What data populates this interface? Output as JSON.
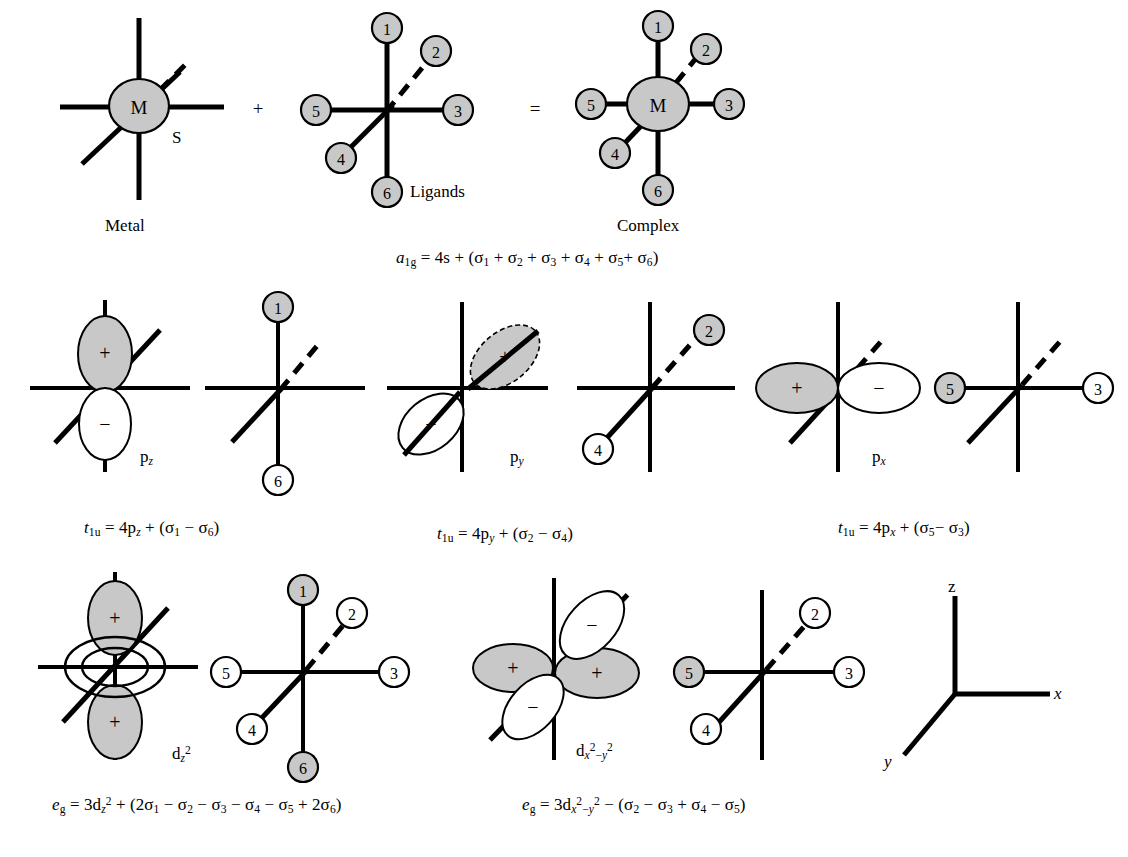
{
  "figure": {
    "domain": "chemistry-orbital-diagram",
    "background": "#ffffff",
    "stroke": "#000000",
    "shaded_fill": "#c8c8c8",
    "white_fill": "#ffffff"
  },
  "row1": {
    "metal": {
      "center_label": "M",
      "s_label": "S",
      "caption": "Metal"
    },
    "plus_sign": "+",
    "ligands": {
      "caption": "Ligands",
      "numbers": [
        "1",
        "2",
        "3",
        "4",
        "5",
        "6"
      ],
      "shaded": [
        true,
        true,
        true,
        true,
        true,
        true
      ]
    },
    "equals_sign": "=",
    "complex": {
      "center_label": "M",
      "caption": "Complex",
      "numbers": [
        "1",
        "2",
        "3",
        "4",
        "5",
        "6"
      ],
      "shaded": [
        true,
        true,
        true,
        true,
        true,
        true
      ]
    },
    "equation": {
      "sym": "a",
      "sym_sub": "1g",
      "eq": "= 4s + (σ",
      "text": "a1g = 4s + (σ1 + σ2 + σ3 + σ4 + σ5 + σ6)"
    }
  },
  "row2": {
    "panels": [
      {
        "orbital_label": "p",
        "orbital_sub": "z",
        "lobes": [
          {
            "sign": "+",
            "shaded": true,
            "position": "up"
          },
          {
            "sign": "−",
            "shaded": false,
            "position": "down"
          }
        ],
        "ligand_numbers": [
          "1",
          "6"
        ],
        "ligand_shaded": [
          true,
          false
        ],
        "equation_text": "t1u = 4pz + (σ1 − σ6)",
        "eq_sym": "t",
        "eq_sub": "1u",
        "eq_mid": "= 4p",
        "eq_orb": "z",
        "eq_tail_a": "1",
        "eq_tail_b": "6",
        "eq_op": "−"
      },
      {
        "orbital_label": "p",
        "orbital_sub": "y",
        "lobes": [
          {
            "sign": "+",
            "shaded": true,
            "position": "up-right-diagonal"
          },
          {
            "sign": "−",
            "shaded": false,
            "position": "down-left-diagonal"
          }
        ],
        "ligand_numbers": [
          "2",
          "4"
        ],
        "ligand_shaded": [
          true,
          false
        ],
        "equation_text": "t1u = 4py + (σ2 − σ4)",
        "eq_sym": "t",
        "eq_sub": "1u",
        "eq_mid": "= 4p",
        "eq_orb": "y",
        "eq_tail_a": "2",
        "eq_tail_b": "4",
        "eq_op": "−"
      },
      {
        "orbital_label": "p",
        "orbital_sub": "x",
        "lobes": [
          {
            "sign": "+",
            "shaded": true,
            "position": "left"
          },
          {
            "sign": "−",
            "shaded": false,
            "position": "right"
          }
        ],
        "ligand_numbers": [
          "5",
          "3"
        ],
        "ligand_shaded": [
          true,
          false
        ],
        "equation_text": "t1u = 4px + (σ5 − σ3)",
        "eq_sym": "t",
        "eq_sub": "1u",
        "eq_mid": "= 4p",
        "eq_orb": "x",
        "eq_tail_a": "5",
        "eq_tail_b": "3",
        "eq_op": "−"
      }
    ]
  },
  "row3": {
    "panels": [
      {
        "orbital_label": "d",
        "orbital_sub": "z",
        "orbital_sup": "2",
        "lobes": [
          {
            "sign": "+",
            "shaded": true,
            "position": "up"
          },
          {
            "sign": "+",
            "shaded": true,
            "position": "down"
          },
          {
            "sign": "−",
            "shaded": false,
            "position": "torus"
          }
        ],
        "ligand_numbers": [
          "1",
          "2",
          "3",
          "4",
          "5",
          "6"
        ],
        "ligand_shaded": [
          true,
          false,
          false,
          false,
          false,
          true
        ],
        "equation_text": "eg = 3dz2 + (2σ1 − σ2 − σ3 − σ4 − σ5 + 2σ6)"
      },
      {
        "orbital_label": "d",
        "orbital_sub_x": "x",
        "orbital_sup": "2",
        "orbital_sub_y": "y",
        "lobes": [
          {
            "sign": "+",
            "shaded": true,
            "position": "left"
          },
          {
            "sign": "+",
            "shaded": true,
            "position": "right"
          },
          {
            "sign": "−",
            "shaded": false,
            "position": "up-diagonal"
          },
          {
            "sign": "−",
            "shaded": false,
            "position": "down-diagonal"
          }
        ],
        "ligand_numbers": [
          "2",
          "3",
          "4",
          "5"
        ],
        "ligand_shaded": [
          false,
          false,
          false,
          true
        ],
        "equation_text": "eg = 3dx2−y2 − (σ2 − σ3 + σ4 − σ5)"
      }
    ],
    "axes": {
      "labels": {
        "z": "z",
        "x": "x",
        "y": "y"
      }
    }
  },
  "equations": {
    "a1g": {
      "lead": "a",
      "sub": "1g",
      "body": "= 4s + (σ",
      "terms": [
        "1",
        "2",
        "3",
        "4",
        "5",
        "6"
      ],
      "ops": [
        "+",
        "+",
        "+",
        "+",
        "+"
      ],
      "close": ")"
    },
    "t1u_z": {
      "lead": "t",
      "sub": "1u",
      "body": "= 4p",
      "orb": "z",
      "terms": [
        "1",
        "6"
      ],
      "op": "−"
    },
    "t1u_y": {
      "lead": "t",
      "sub": "1u",
      "body": "= 4p",
      "orb": "y",
      "terms": [
        "2",
        "4"
      ],
      "op": "−"
    },
    "t1u_x": {
      "lead": "t",
      "sub": "1u",
      "body": "= 4p",
      "orb": "x",
      "terms": [
        "5",
        "3"
      ],
      "op": "−"
    },
    "eg_z2": {
      "lead": "e",
      "sub": "g",
      "body": "= 3d",
      "terms": [
        "1",
        "2",
        "3",
        "4",
        "5",
        "6"
      ],
      "coeffs": [
        "2",
        "",
        "",
        "",
        "",
        "2"
      ],
      "ops": [
        "−",
        "−",
        "−",
        "−",
        "+"
      ]
    },
    "eg_x2y2": {
      "lead": "e",
      "sub": "g",
      "body": "= 3d",
      "terms": [
        "2",
        "3",
        "4",
        "5"
      ],
      "ops": [
        "−",
        "+",
        "−"
      ]
    }
  },
  "labels": {
    "metal": "Metal",
    "ligands": "Ligands",
    "complex": "Complex",
    "s_orbital": "S",
    "plus": "+",
    "equals": "="
  }
}
